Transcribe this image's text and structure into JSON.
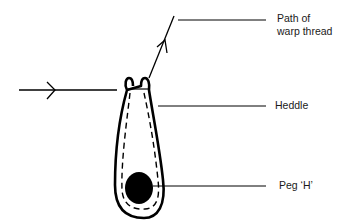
{
  "diagram": {
    "labels": {
      "path_line1": "Path of",
      "path_line2": "warp thread",
      "heddle": "Heddle",
      "peg": "Peg ‘H’"
    },
    "colors": {
      "ink": "#000000",
      "background": "#ffffff",
      "text": "#1a1a1a"
    }
  }
}
